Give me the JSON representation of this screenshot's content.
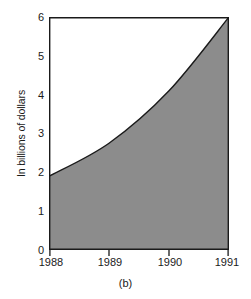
{
  "figure": {
    "caption": "(b)"
  },
  "chart_data": {
    "type": "area",
    "title": "",
    "subtitle": "",
    "xlabel": "",
    "ylabel": "In billions of dollars",
    "categories": [
      "1988",
      "1989",
      "1990",
      "1991"
    ],
    "x": [
      1988,
      1989,
      1990,
      1991
    ],
    "values": [
      1.9,
      2.75,
      4.1,
      6.0
    ],
    "series": [
      {
        "name": "In billions of dollars",
        "values": [
          1.9,
          2.75,
          4.1,
          6.0
        ]
      }
    ],
    "xlim": [
      1988,
      1991
    ],
    "ylim": [
      0,
      6
    ],
    "x_tick_labels": [
      "1988",
      "1989",
      "1990",
      "1991"
    ],
    "y_tick_labels": [
      "0",
      "1",
      "2",
      "3",
      "4",
      "5",
      "6"
    ],
    "y_ticks": [
      0,
      1,
      2,
      3,
      4,
      5,
      6
    ],
    "grid": false,
    "legend": false,
    "legend_position": "none",
    "annotations": [],
    "colors": {
      "fill": "#8c8c8c",
      "line": "#1a1a1a",
      "axis": "#1a1a1a",
      "background": "#ffffff",
      "text": "#1a1a1a"
    }
  }
}
